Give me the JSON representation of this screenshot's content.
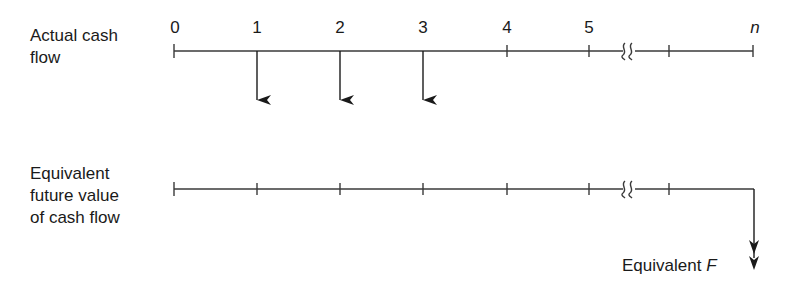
{
  "diagram": {
    "type": "cash-flow-diagram",
    "rows": [
      {
        "label_lines": [
          "Actual cash",
          "flow"
        ],
        "period_labels": [
          "0",
          "1",
          "2",
          "3",
          "4",
          "5",
          "n"
        ],
        "axis_break_after_period": "5",
        "cash_flows": [
          {
            "period": "1",
            "direction": "down"
          },
          {
            "period": "2",
            "direction": "down"
          },
          {
            "period": "3",
            "direction": "down"
          }
        ]
      },
      {
        "label_lines": [
          "Equivalent",
          "future value",
          "of cash flow"
        ],
        "axis_break_after_period": "5",
        "cash_flows": [
          {
            "period": "n",
            "direction": "down",
            "label": "Equivalent",
            "label_symbol": "F"
          }
        ]
      }
    ],
    "colors": {
      "line": "#3a3a3a",
      "text": "#1a1a1a",
      "background": "#ffffff"
    }
  }
}
